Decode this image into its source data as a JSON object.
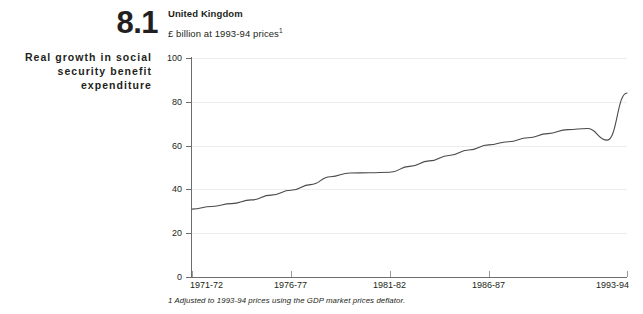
{
  "figure": {
    "number": "8.1",
    "title": "Real growth in social security benefit expenditure"
  },
  "chart_header": {
    "country": "United Kingdom",
    "units": "£ billion at 1993-94 prices",
    "units_footnote_marker": "1"
  },
  "footnote": "1 Adjusted to 1993-94 prices using the GDP market prices deflator.",
  "axis": {
    "y_ticks": [
      "0",
      "20",
      "40",
      "60",
      "80",
      "100"
    ],
    "x_ticks": [
      "1971-72",
      "1976-77",
      "1981-82",
      "1986-87",
      "1993-94"
    ]
  },
  "colors": {
    "line": "#4a4a4a",
    "axis": "#6d6d6d",
    "grid": "#ededed",
    "text": "#231f20",
    "background": "#ffffff"
  },
  "chart_data": {
    "type": "line",
    "title": "Real growth in social security benefit expenditure",
    "subtitle": "United Kingdom",
    "xlabel": "",
    "ylabel": "£ billion at 1993-94 prices",
    "ylim": [
      0,
      100
    ],
    "grid": true,
    "legend": "none",
    "x": [
      "1971-72",
      "1972-73",
      "1973-74",
      "1974-75",
      "1975-76",
      "1976-77",
      "1977-78",
      "1978-79",
      "1979-80",
      "1980-81",
      "1981-82",
      "1982-83",
      "1983-84",
      "1984-85",
      "1985-86",
      "1986-87",
      "1987-88",
      "1988-89",
      "1989-90",
      "1990-91",
      "1991-92",
      "1992-93",
      "1993-94"
    ],
    "x_tick_labels": [
      "1971-72",
      "1976-77",
      "1981-82",
      "1986-87",
      "1993-94"
    ],
    "series": [
      {
        "name": "Social security benefit expenditure",
        "values": [
          31.0,
          32.2,
          33.5,
          35.2,
          37.4,
          39.6,
          42.2,
          45.8,
          47.5,
          47.6,
          47.8,
          50.5,
          53.0,
          55.5,
          58.0,
          60.3,
          61.8,
          63.6,
          65.5,
          67.3,
          67.8,
          66.0,
          63.5
        ]
      }
    ],
    "note": "Series continues: after 1990-91 peak near 68 there is a dip to about 62 around 1991-92, then a steep rise to about 84 by 1993-94"
  }
}
